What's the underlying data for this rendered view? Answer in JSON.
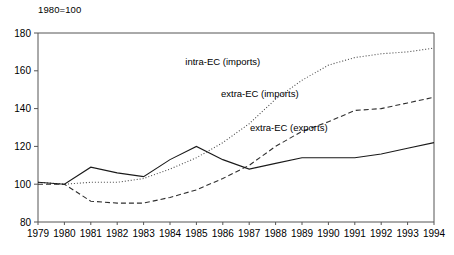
{
  "chart_data": {
    "type": "line",
    "title": "",
    "subtitle": "1980=100",
    "xlabel": "",
    "ylabel": "",
    "xlim": [
      1979,
      1994
    ],
    "ylim": [
      80,
      180
    ],
    "yticks": [
      80,
      100,
      120,
      140,
      160,
      180
    ],
    "grid": false,
    "legend_position": "inline-annotations",
    "categories": [
      1979,
      1980,
      1981,
      1982,
      1983,
      1984,
      1985,
      1986,
      1987,
      1988,
      1989,
      1990,
      1991,
      1992,
      1993,
      1994
    ],
    "xtick_labels": [
      "1979",
      "1980",
      "1981",
      "1982",
      "1983",
      "1984",
      "1985",
      "1986",
      "1987",
      "1988",
      "1989",
      "1990",
      "1991",
      "1992",
      "1993",
      "1994"
    ],
    "ytick_labels": [
      "80",
      "100",
      "120",
      "140",
      "160",
      "180"
    ],
    "series": [
      {
        "name": "intra-EC (imports)",
        "style": "dotted",
        "color": "#4a4a4a",
        "label_x": 1986.0,
        "label_y": 163,
        "values": [
          101,
          100,
          101,
          101,
          103,
          108,
          114,
          122,
          132,
          145,
          155,
          163,
          167,
          169,
          170,
          172
        ]
      },
      {
        "name": "extra-EC (imports)",
        "style": "dashed",
        "color": "#2e2e2e",
        "label_x": 1987.4,
        "label_y": 146,
        "values": [
          100,
          100,
          91,
          90,
          90,
          93,
          97,
          103,
          110,
          120,
          128,
          133,
          139,
          140,
          143,
          146
        ]
      },
      {
        "name": "extra-EC (exports)",
        "style": "solid",
        "color": "#1a1a1a",
        "label_x": 1988.5,
        "label_y": 128,
        "values": [
          101,
          100,
          109,
          106,
          104,
          113,
          120,
          113,
          108,
          111,
          114,
          114,
          114,
          116,
          119,
          122
        ]
      }
    ]
  }
}
